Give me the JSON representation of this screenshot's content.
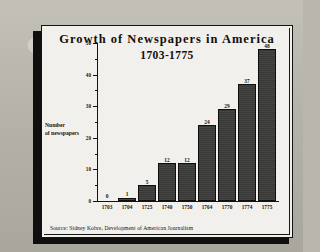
{
  "figure": {
    "title": "Growth of Newspapers in America",
    "subtitle": "1703-1775",
    "source": "Source: Sidney Kobre, Development of American Journalism",
    "ylabel_line1": "Number",
    "ylabel_line2": "of newspapers"
  },
  "colors": {
    "bar_fill": "#3b3b39",
    "bar_outline": "#100f0d",
    "paper": "#f2f0ec",
    "ink": "#14120e",
    "backdrop": "#b9b6ad",
    "shadow": "#100f0d"
  },
  "chart_data": {
    "type": "bar",
    "title": "Growth of Newspapers in America",
    "subtitle": "1703-1775",
    "xlabel": "",
    "ylabel": "Number of newspapers",
    "categories": [
      "1703",
      "1704",
      "1725",
      "1740",
      "1750",
      "1764",
      "1770",
      "1774",
      "1775"
    ],
    "values": [
      0,
      1,
      5,
      12,
      12,
      24,
      29,
      37,
      48
    ],
    "data_labels": [
      "0",
      "1",
      "5",
      "12",
      "12",
      "24",
      "29",
      "37",
      "48"
    ],
    "ylim": [
      0,
      50
    ],
    "yticks": [
      0,
      10,
      20,
      30,
      40,
      50
    ],
    "ytick_labels": [
      "0",
      "10",
      "20",
      "30",
      "40",
      "50"
    ],
    "yminor_ticks": [
      5,
      15,
      25,
      35,
      45
    ],
    "grid": false,
    "legend": false,
    "bars_contiguous": true,
    "source": "Source: Sidney Kobre, Development of American Journalism"
  }
}
